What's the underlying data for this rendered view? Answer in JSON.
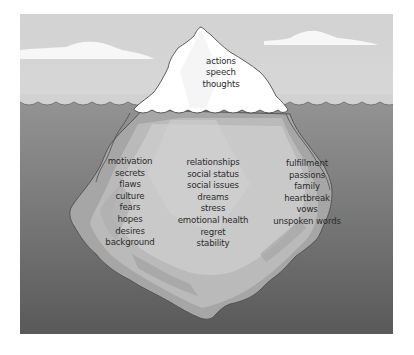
{
  "diagram": {
    "type": "iceberg",
    "colors": {
      "sky": "#d4d4d4",
      "cloud": "#fafafa",
      "iceberg_tip": "#ffffff",
      "water_top": "#8e8e8e",
      "water_bottom": "#5a5a5a",
      "iceberg_underwater_light": "#c9c9c9",
      "iceberg_underwater_mid": "#b3b3b3",
      "iceberg_underwater_dark": "#a0a0a0",
      "outline": "#555555",
      "text": "#2b2b2b"
    },
    "above_water": {
      "labels": [
        "actions",
        "speech",
        "thoughts"
      ]
    },
    "below_water": {
      "columns": [
        {
          "labels": [
            "motivation",
            "secrets",
            "flaws",
            "culture",
            "fears",
            "hopes",
            "desires",
            "background"
          ]
        },
        {
          "labels": [
            "relationships",
            "social status",
            "social issues",
            "dreams",
            "stress",
            "emotional health",
            "regret",
            "stability"
          ]
        },
        {
          "labels": [
            "fulfillment",
            "passions",
            "family",
            "heartbreak",
            "vows",
            "unspoken words"
          ]
        }
      ]
    }
  }
}
